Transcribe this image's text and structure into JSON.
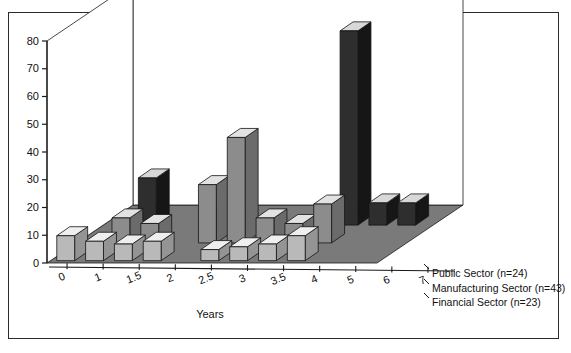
{
  "figure": {
    "background": "#ffffff",
    "border_color": "#2b2b2b",
    "axis_color": "#1a1a1a",
    "floor_color": "#7a7a7a",
    "wall_color": "#ffffff"
  },
  "chart_data": {
    "type": "bar",
    "subtype": "3d-grouped-bar",
    "title": "",
    "xlabel": "Years",
    "ylabel": "",
    "ylim": [
      0,
      80
    ],
    "yticks": [
      0,
      10,
      20,
      30,
      40,
      50,
      60,
      70,
      80
    ],
    "grid": false,
    "legend_position": "right-bottom",
    "categories": [
      "0",
      "1",
      "1.5",
      "2",
      "2.5",
      "3",
      "3.5",
      "4",
      "5",
      "6",
      "7"
    ],
    "series": [
      {
        "name": "Public Sector (n=24)",
        "n": 24,
        "color": "#2e2e2e",
        "top_color": "#d8d8d8",
        "side_color": "#161616",
        "depth_row": 0,
        "values": [
          0,
          17,
          0,
          0,
          0,
          0,
          0,
          0,
          70,
          8,
          8
        ]
      },
      {
        "name": "Manufacturing Sector (n=43)",
        "n": 43,
        "color": "#8c8c8c",
        "top_color": "#e2e2e2",
        "side_color": "#6b6b6b",
        "depth_row": 1,
        "values": [
          0,
          9,
          7,
          0,
          21,
          38,
          9,
          7,
          14,
          0,
          0
        ]
      },
      {
        "name": "Financial Sector (n=23)",
        "n": 23,
        "color": "#b9b9b9",
        "top_color": "#efefef",
        "side_color": "#949494",
        "depth_row": 2,
        "values": [
          9,
          7,
          6,
          7,
          0,
          4,
          5,
          6,
          9,
          0,
          0
        ]
      }
    ]
  },
  "legend": {
    "entries": [
      {
        "label": "Public Sector (n=24)"
      },
      {
        "label": "Manufacturing Sector (n=43)"
      },
      {
        "label": "Financial Sector (n=23)"
      }
    ]
  },
  "axes": {
    "x_title": "Years",
    "x_ticks": [
      "0",
      "1",
      "1.5",
      "2",
      "2.5",
      "3",
      "3.5",
      "4",
      "5",
      "6",
      "7"
    ],
    "y_ticks": [
      "0",
      "10",
      "20",
      "30",
      "40",
      "50",
      "60",
      "70",
      "80"
    ]
  }
}
